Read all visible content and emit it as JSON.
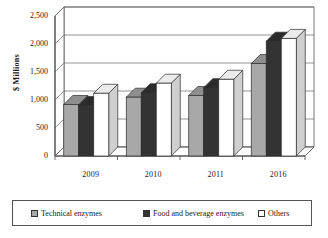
{
  "chart_data": {
    "type": "bar",
    "title": "",
    "xlabel": "",
    "ylabel": "$ Millions",
    "categories": [
      "2009",
      "2010",
      "2011",
      "2016"
    ],
    "series": [
      {
        "name": "Technical enzymes",
        "color": "#a8a8a8",
        "values": [
          920,
          1050,
          1080,
          1650
        ]
      },
      {
        "name": "Food and beverage enzymes",
        "color": "#333333",
        "values": [
          900,
          1130,
          1220,
          2050
        ]
      },
      {
        "name": "Others",
        "color": "#ffffff",
        "values": [
          1120,
          1300,
          1370,
          2100
        ]
      }
    ],
    "ylim": [
      0,
      2500
    ],
    "yticks": [
      "0",
      "500",
      "1,000",
      "1,500",
      "2,000",
      "2,500"
    ],
    "ytick_values": [
      0,
      500,
      1000,
      1500,
      2000,
      2500
    ],
    "grid": true,
    "legend_position": "bottom",
    "threed": true
  },
  "legend": {
    "items": [
      {
        "label": "Technical enzymes",
        "swatch": "#a8a8a8"
      },
      {
        "label": "Food and beverage enzymes",
        "swatch": "#333333"
      },
      {
        "label": "Others",
        "swatch": "#ffffff"
      }
    ]
  },
  "colors": {
    "series_technical": "#a8a8a8",
    "series_food": "#333333",
    "series_others": "#ffffff",
    "axis": "#444444",
    "grid": "#666666",
    "background": "#ffffff"
  }
}
